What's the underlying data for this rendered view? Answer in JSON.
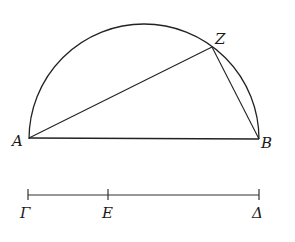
{
  "figure": {
    "points": {
      "A": {
        "label": "A",
        "x": 29,
        "y": 138
      },
      "B": {
        "label": "B",
        "x": 259,
        "y": 139
      },
      "Z": {
        "label": "Z",
        "x": 212,
        "y": 47
      }
    },
    "semicircle": {
      "cx": 144,
      "cy": 139,
      "r": 115
    },
    "segments": [
      "AB",
      "AZ",
      "ZB"
    ],
    "line": {
      "y": 195,
      "points": [
        {
          "label": "Γ",
          "x": 28
        },
        {
          "label": "E",
          "x": 108
        },
        {
          "label": "Δ",
          "x": 259
        }
      ]
    },
    "stroke_color": "#222222"
  }
}
